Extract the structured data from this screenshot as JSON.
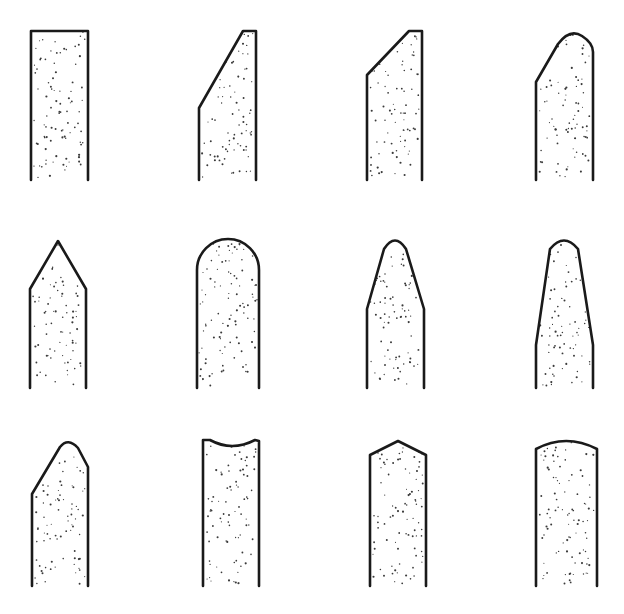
{
  "figure": {
    "rows": 3,
    "columns": 4,
    "stroke_color": "#1a1a1a",
    "stipple_color": "#3a3a3a",
    "background": "#ffffff"
  },
  "shapes": [
    {
      "id": 1,
      "row": 1,
      "col": 1,
      "profile": "flat-top",
      "path": "M31,180 L31,31 L88,31 L88,180"
    },
    {
      "id": 2,
      "row": 1,
      "col": 2,
      "profile": "steep-bevel-left",
      "path": "M199,180 L199,108 L243,31 L256,31 L256,180"
    },
    {
      "id": 3,
      "row": 1,
      "col": 3,
      "profile": "shallow-bevel-left",
      "path": "M367,180 L367,75 L409,31 L422,31 L422,180"
    },
    {
      "id": 4,
      "row": 1,
      "col": 4,
      "profile": "bevel-left-rounded-top",
      "path": "M536,180 L536,82 L558,44 Q570,28 582,36 Q593,43 593,52 L593,180"
    },
    {
      "id": 5,
      "row": 2,
      "col": 1,
      "profile": "pointed-symmetric",
      "path": "M30,388 L30,289 L58,241 L86,289 L86,388"
    },
    {
      "id": 6,
      "row": 2,
      "col": 2,
      "profile": "full-radius",
      "path": "M197,388 L197,270 A31,31 0 0 1 259,270 L259,388"
    },
    {
      "id": 7,
      "row": 2,
      "col": 3,
      "profile": "taper-short-rounded",
      "path": "M367,388 L367,309 L384,249 Q395,232 406,249 L424,309 L424,388"
    },
    {
      "id": 8,
      "row": 2,
      "col": 4,
      "profile": "taper-long-rounded",
      "path": "M536,388 L536,345 L550,249 Q564,232 578,249 L593,345 L593,388"
    },
    {
      "id": 9,
      "row": 3,
      "col": 1,
      "profile": "asymmetric-bevel-rounded",
      "path": "M32,586 L32,494 L60,447 Q68,437 78,448 L88,467 L88,586"
    },
    {
      "id": 10,
      "row": 3,
      "col": 2,
      "profile": "concave-top",
      "path": "M203,586 L203,440 L210,440 Q232,452 255,440 L259,441 L259,586"
    },
    {
      "id": 11,
      "row": 3,
      "col": 3,
      "profile": "shallow-point",
      "path": "M370,586 L370,455 L398,441 L426,455 L426,586"
    },
    {
      "id": 12,
      "row": 3,
      "col": 4,
      "profile": "convex-top",
      "path": "M536,586 L536,449 Q566,433 597,449 L597,586"
    }
  ]
}
